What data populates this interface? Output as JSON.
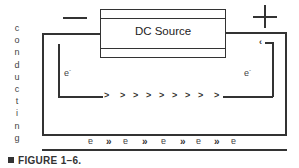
{
  "figure": {
    "side_label": "conducting",
    "side_letters": [
      "c",
      "o",
      "n",
      "d",
      "u",
      "c",
      "t",
      "i",
      "n",
      "g"
    ],
    "source_label": "DC Source",
    "negative_terminal": "−",
    "positive_terminal": "+",
    "left_electron_label": "e",
    "right_electron_label": "e",
    "electron_charge": "-",
    "flow_chevrons": [
      ">",
      ">",
      ">",
      ">",
      ">",
      ">",
      ">",
      ">",
      ">"
    ],
    "conductor_row": [
      {
        "type": "electron",
        "text": "e",
        "charge": "-"
      },
      {
        "type": "arrows",
        "text": "»"
      },
      {
        "type": "electron",
        "text": "e",
        "charge": "-"
      },
      {
        "type": "arrows",
        "text": "»"
      },
      {
        "type": "electron",
        "text": "e",
        "charge": "-"
      },
      {
        "type": "arrows",
        "text": "»"
      },
      {
        "type": "electron",
        "text": "e",
        "charge": "-"
      },
      {
        "type": "arrows",
        "text": "»"
      },
      {
        "type": "electron",
        "text": "e",
        "charge": "-"
      }
    ],
    "caption": "FIGURE 1–6."
  }
}
